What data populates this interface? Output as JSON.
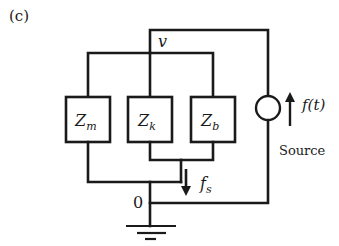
{
  "figure": {
    "panel_label": "(c)",
    "node_top_label": "v",
    "node_ground_label": "0"
  },
  "elements": [
    {
      "id": "mass",
      "label_main": "Z",
      "label_sub": "m"
    },
    {
      "id": "spring",
      "label_main": "Z",
      "label_sub": "k"
    },
    {
      "id": "damper",
      "label_main": "Z",
      "label_sub": "b"
    }
  ],
  "source": {
    "signal_label": "f(t)",
    "caption": "Source"
  },
  "flow": {
    "label_main": "f",
    "label_sub": "s"
  },
  "colors": {
    "line": "#1a1a1a",
    "background": "#ffffff"
  }
}
